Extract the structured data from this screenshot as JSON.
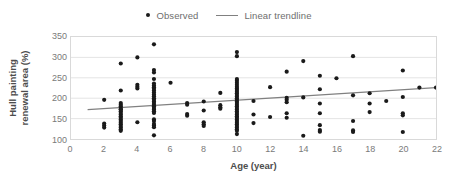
{
  "legend": {
    "position": "top-center",
    "entries": [
      {
        "label": "Observed",
        "marker": "dot",
        "color": "#1a1a1a",
        "icon": "scatter-dot-icon"
      },
      {
        "label": "Linear trendline",
        "marker": "line",
        "color": "#808080",
        "icon": "trendline-icon"
      }
    ]
  },
  "axes": {
    "x": {
      "title": "Age (year)",
      "ticks": [
        "0",
        "2",
        "4",
        "6",
        "8",
        "10",
        "12",
        "14",
        "16",
        "18",
        "20",
        "22"
      ]
    },
    "y": {
      "title_line1": "Hull painting",
      "title_line2": "renewal area (%)",
      "title": "Hull painting renewal area (%)",
      "ticks": [
        "350",
        "300",
        "250",
        "200",
        "150",
        "100"
      ]
    }
  },
  "colors": {
    "marker": "#1a1a1a",
    "trendline": "#808080",
    "gridline": "#e4e4e4",
    "plot_border": "#d9d9d9",
    "tick_text": "#7a7a7a",
    "axis_title": "#4d4d4d",
    "background": "#ffffff"
  },
  "chart_data": {
    "type": "scatter",
    "title": "",
    "xlabel": "Age (year)",
    "ylabel": "Hull painting renewal area (%)",
    "xlim": [
      0,
      22
    ],
    "ylim": [
      100,
      350
    ],
    "xticks": [
      0,
      2,
      4,
      6,
      8,
      10,
      12,
      14,
      16,
      18,
      20,
      22
    ],
    "yticks": [
      100,
      150,
      200,
      250,
      300,
      350
    ],
    "grid": "horizontal",
    "legend_position": "top-center",
    "series": [
      {
        "name": "Observed",
        "type": "scatter",
        "marker": "circle",
        "color": "#1a1a1a",
        "points": [
          [
            2,
            196
          ],
          [
            2,
            138
          ],
          [
            2,
            133
          ],
          [
            2,
            128
          ],
          [
            3,
            285
          ],
          [
            3,
            219
          ],
          [
            3,
            188
          ],
          [
            3,
            184
          ],
          [
            3,
            180
          ],
          [
            3,
            176
          ],
          [
            3,
            172
          ],
          [
            3,
            168
          ],
          [
            3,
            164
          ],
          [
            3,
            160
          ],
          [
            3,
            156
          ],
          [
            3,
            152
          ],
          [
            3,
            148
          ],
          [
            3,
            144
          ],
          [
            3,
            140
          ],
          [
            3,
            136
          ],
          [
            3,
            132
          ],
          [
            3,
            128
          ],
          [
            3,
            124
          ],
          [
            3,
            120
          ],
          [
            3,
            172
          ],
          [
            4,
            300
          ],
          [
            4,
            233
          ],
          [
            4,
            228
          ],
          [
            4,
            224
          ],
          [
            4,
            141
          ],
          [
            5,
            332
          ],
          [
            5,
            269
          ],
          [
            5,
            263
          ],
          [
            5,
            247
          ],
          [
            5,
            236
          ],
          [
            5,
            231
          ],
          [
            5,
            227
          ],
          [
            5,
            223
          ],
          [
            5,
            219
          ],
          [
            5,
            214
          ],
          [
            5,
            209
          ],
          [
            5,
            205
          ],
          [
            5,
            200
          ],
          [
            5,
            196
          ],
          [
            5,
            192
          ],
          [
            5,
            188
          ],
          [
            5,
            184
          ],
          [
            5,
            180
          ],
          [
            5,
            176
          ],
          [
            5,
            172
          ],
          [
            5,
            168
          ],
          [
            5,
            164
          ],
          [
            5,
            148
          ],
          [
            5,
            144
          ],
          [
            5,
            137
          ],
          [
            5,
            133
          ],
          [
            5,
            129
          ],
          [
            5,
            109
          ],
          [
            6,
            238
          ],
          [
            7,
            188
          ],
          [
            7,
            184
          ],
          [
            7,
            161
          ],
          [
            7,
            157
          ],
          [
            8,
            192
          ],
          [
            8,
            170
          ],
          [
            8,
            141
          ],
          [
            8,
            136
          ],
          [
            8,
            132
          ],
          [
            9,
            213
          ],
          [
            9,
            183
          ],
          [
            9,
            178
          ],
          [
            9,
            174
          ],
          [
            10,
            313
          ],
          [
            10,
            303
          ],
          [
            10,
            247
          ],
          [
            10,
            243
          ],
          [
            10,
            238
          ],
          [
            10,
            233
          ],
          [
            10,
            228
          ],
          [
            10,
            224
          ],
          [
            10,
            220
          ],
          [
            10,
            216
          ],
          [
            10,
            212
          ],
          [
            10,
            208
          ],
          [
            10,
            204
          ],
          [
            10,
            200
          ],
          [
            10,
            196
          ],
          [
            10,
            192
          ],
          [
            10,
            188
          ],
          [
            10,
            184
          ],
          [
            10,
            180
          ],
          [
            10,
            176
          ],
          [
            10,
            172
          ],
          [
            10,
            168
          ],
          [
            10,
            164
          ],
          [
            10,
            160
          ],
          [
            10,
            156
          ],
          [
            10,
            152
          ],
          [
            10,
            148
          ],
          [
            10,
            144
          ],
          [
            10,
            140
          ],
          [
            10,
            136
          ],
          [
            10,
            132
          ],
          [
            10,
            128
          ],
          [
            10,
            124
          ],
          [
            10,
            120
          ],
          [
            10,
            112
          ],
          [
            11,
            193
          ],
          [
            11,
            160
          ],
          [
            11,
            139
          ],
          [
            12,
            227
          ],
          [
            12,
            154
          ],
          [
            13,
            265
          ],
          [
            13,
            201
          ],
          [
            13,
            196
          ],
          [
            13,
            190
          ],
          [
            13,
            163
          ],
          [
            13,
            152
          ],
          [
            14,
            291
          ],
          [
            14,
            202
          ],
          [
            14,
            108
          ],
          [
            15,
            255
          ],
          [
            15,
            222
          ],
          [
            15,
            187
          ],
          [
            15,
            163
          ],
          [
            15,
            134
          ],
          [
            15,
            122
          ],
          [
            15,
            118
          ],
          [
            16,
            249
          ],
          [
            17,
            303
          ],
          [
            17,
            207
          ],
          [
            17,
            144
          ],
          [
            17,
            121
          ],
          [
            17,
            117
          ],
          [
            18,
            212
          ],
          [
            18,
            187
          ],
          [
            18,
            166
          ],
          [
            19,
            193
          ],
          [
            20,
            268
          ],
          [
            20,
            203
          ],
          [
            20,
            163
          ],
          [
            20,
            158
          ],
          [
            20,
            117
          ],
          [
            21,
            226
          ],
          [
            22,
            226
          ]
        ]
      },
      {
        "name": "Linear trendline",
        "type": "line",
        "color": "#808080",
        "x_start": 1,
        "x_end": 22,
        "y_start": 172,
        "y_end": 226
      }
    ]
  }
}
